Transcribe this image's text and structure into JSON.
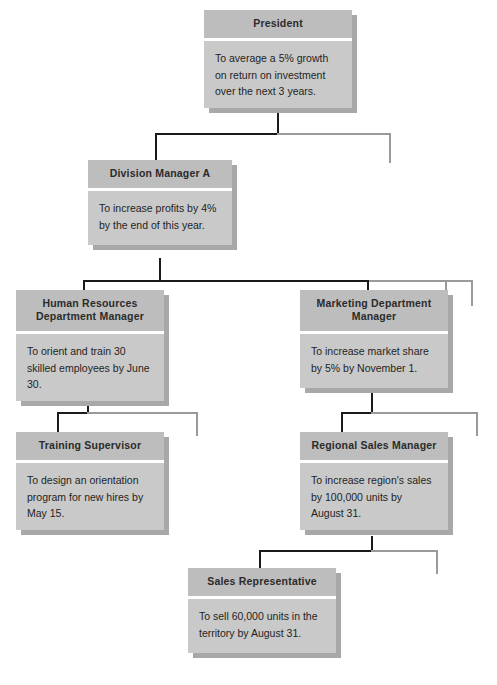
{
  "chart": {
    "type": "organizational-hierarchy",
    "nodes": [
      {
        "id": "president",
        "title": "President",
        "goal": "To average a 5% growth on return on investment over the next 3 years.",
        "level": 1
      },
      {
        "id": "division-manager-a",
        "title": "Division Manager A",
        "goal": "To increase profits by 4% by the end of this year.",
        "level": 2
      },
      {
        "id": "human-resources-department-manager",
        "title": "Human Resources Department Manager",
        "goal": "To orient and train 30 skilled employees by June 30.",
        "level": 3
      },
      {
        "id": "marketing-department-manager",
        "title": "Marketing Department Manager",
        "goal": "To increase market share by 5% by November 1.",
        "level": 3
      },
      {
        "id": "training-supervisor",
        "title": "Training Supervisor",
        "goal": "To design an orientation program for new hires by May 15.",
        "level": 4
      },
      {
        "id": "regional-sales-manager",
        "title": "Regional Sales Manager",
        "goal": "To increase region's sales by 100,000 units by August 31.",
        "level": 4
      },
      {
        "id": "sales-representative",
        "title": "Sales Representative",
        "goal": "To sell 60,000 units in the territory by August 31.",
        "level": 5
      }
    ],
    "colors": {
      "box_header": "#bdbdbd",
      "box_body": "#c9c9c9",
      "box_shadow": "#a8a8a8",
      "connector": "#1a1a1a",
      "connector_faint": "#9a9a9a",
      "background": "#ffffff",
      "text": "#1f1f1f"
    }
  }
}
